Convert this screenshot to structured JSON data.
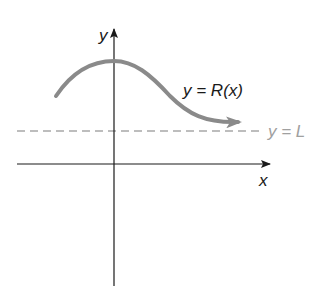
{
  "diagram": {
    "type": "function-graph",
    "axes": {
      "x_label": "x",
      "y_label": "y"
    },
    "curve": {
      "label": "y = R(x)",
      "color": "#8a8a8a",
      "behavior": "rises to a maximum on the y-axis then decreases toward the asymptote"
    },
    "asymptote": {
      "label": "y = L",
      "style": "dashed",
      "color": "#a0a0a0"
    },
    "colors": {
      "axes": "#1a1a1a",
      "text": "#1a1a1a",
      "background": "#ffffff"
    }
  }
}
